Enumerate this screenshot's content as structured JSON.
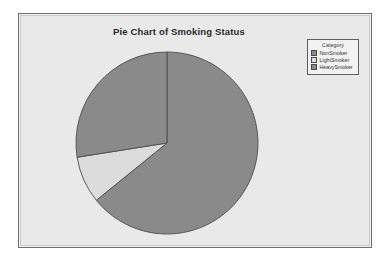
{
  "figure": {
    "title": "Pie Chart of Smoking Status",
    "background_color": "#e9e9e9",
    "border_color": "#6e6e6e"
  },
  "legend": {
    "title": "Category",
    "position": "top-right",
    "entries": [
      {
        "label": "NonSmoker",
        "color": "#8a8a8a"
      },
      {
        "label": "LightSmoker",
        "color": "#dcdcdc"
      },
      {
        "label": "HeavySmoker",
        "color": "#8a8a8a"
      }
    ]
  },
  "chart_data": {
    "type": "pie",
    "title": "Pie Chart of Smoking Status",
    "xlabel": "",
    "ylabel": "",
    "legend_title": "Category",
    "legend_position": "top-right",
    "start_angle_deg": 0,
    "direction": "clockwise",
    "categories": [
      "NonSmoker",
      "LightSmoker",
      "HeavySmoker"
    ],
    "values": [
      64.2,
      8.3,
      27.5
    ],
    "units": "percent",
    "colors": [
      "#8a8a8a",
      "#dcdcdc",
      "#8a8a8a"
    ],
    "slices": [
      {
        "label": "NonSmoker",
        "value": 64.2,
        "start_deg": 0,
        "end_deg": 231,
        "color": "#8a8a8a"
      },
      {
        "label": "LightSmoker",
        "value": 8.3,
        "start_deg": 231,
        "end_deg": 261,
        "color": "#dcdcdc"
      },
      {
        "label": "HeavySmoker",
        "value": 27.5,
        "start_deg": 261,
        "end_deg": 360,
        "color": "#8a8a8a"
      }
    ],
    "geometry": {
      "center_x": 148,
      "center_y": 129,
      "radius": 91
    }
  }
}
